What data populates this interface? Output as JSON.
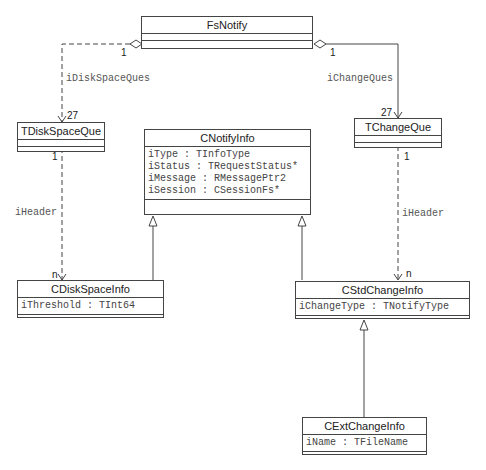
{
  "classes": {
    "fsnotify": {
      "name": "FsNotify"
    },
    "tdiskspaceque": {
      "name": "TDiskSpaceQue"
    },
    "tchangeque": {
      "name": "TChangeQue"
    },
    "cnotifyinfo": {
      "name": "CNotifyInfo",
      "attributes": [
        "iType : TInfoType",
        "iStatus : TRequestStatus*",
        "iMessage : RMessagePtr2",
        "iSession : CSessionFs*"
      ]
    },
    "cdiskspaceinfo": {
      "name": "CDiskSpaceInfo",
      "attributes": [
        "iThreshold : TInt64"
      ]
    },
    "cstdchangeinfo": {
      "name": "CStdChangeInfo",
      "attributes": [
        "iChangeType : TNotifyType"
      ]
    },
    "cextchangeinfo": {
      "name": "CExtChangeInfo",
      "attributes": [
        "iName : TFileName"
      ]
    }
  },
  "associations": {
    "disk_ques": {
      "label": "iDiskSpaceQues",
      "source_mult": "1",
      "target_mult": "27"
    },
    "change_ques": {
      "label": "iChangeQues",
      "source_mult": "1",
      "target_mult": "27"
    },
    "disk_header": {
      "label": "iHeader",
      "source_mult": "1",
      "target_mult": "n"
    },
    "change_header": {
      "label": "iHeader",
      "source_mult": "1",
      "target_mult": "n"
    }
  }
}
